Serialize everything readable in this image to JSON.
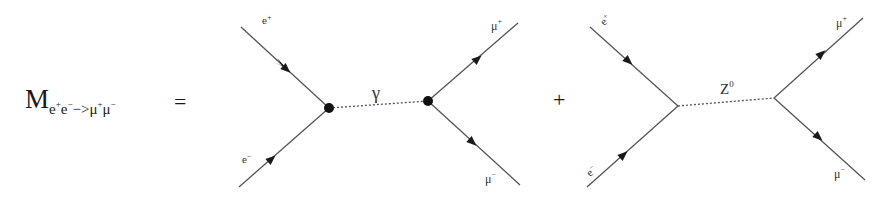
{
  "equation": {
    "lhs_symbol": "M",
    "lhs_sub_1": "e",
    "lhs_sup_1": "+",
    "lhs_sub_2": "e",
    "lhs_sup_2": "−",
    "lhs_arrow": "−>",
    "lhs_sub_3": "μ",
    "lhs_sup_3": "+",
    "lhs_sub_4": "μ",
    "lhs_sup_4": "−",
    "equals": "=",
    "plus": "+"
  },
  "diagrams": [
    {
      "mediator": "γ",
      "mediator_sup": "",
      "vertex_dots": true,
      "incoming_top": {
        "label": "e",
        "sup": "+"
      },
      "incoming_bottom": {
        "label": "e",
        "sup": "−"
      },
      "outgoing_top": {
        "label": "μ",
        "sup": "+"
      },
      "outgoing_bottom": {
        "label": "μ",
        "sup": "−"
      }
    },
    {
      "mediator": "Z",
      "mediator_sup": "0",
      "vertex_dots": false,
      "incoming_top": {
        "label": "e",
        "sup": "+"
      },
      "incoming_bottom": {
        "label": "e",
        "sup": "−"
      },
      "outgoing_top": {
        "label": "μ",
        "sup": "+"
      },
      "outgoing_bottom": {
        "label": "μ",
        "sup": "−"
      }
    }
  ],
  "colors": {
    "line": "#555555",
    "ink": "#1a1a1a"
  }
}
